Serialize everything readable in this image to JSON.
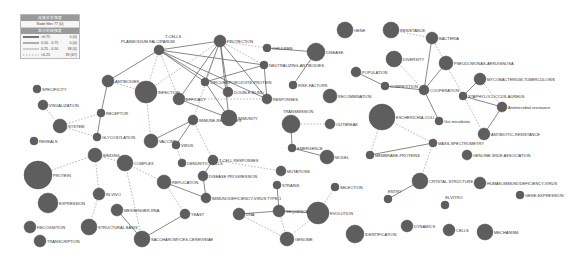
{
  "legend": {
    "title": "连接关系强度",
    "subtitle": "Node filter 77 (0)",
    "header": "显示的线强度",
    "rows": [
      {
        "style": "thick",
        "range": ">0.75",
        "count": "0 (0)"
      },
      {
        "style": "medium",
        "range": "0.50 - 0.75",
        "count": "0 (0)"
      },
      {
        "style": "thin",
        "range": "0.25 - 0.50",
        "count": "38 (0)"
      },
      {
        "style": "dashed",
        "range": "<0.25",
        "count": "39 (67)"
      }
    ]
  },
  "nodes": [
    {
      "id": "t-cells",
      "label": "T-CELLS",
      "x": 159,
      "y": 50,
      "r": 5
    },
    {
      "id": "plasmodium",
      "label": "PLASMODIUM-FALCIPARUM",
      "x": 159,
      "y": 50,
      "r": 0
    },
    {
      "id": "protection",
      "label": "PROTECTION",
      "x": 220,
      "y": 41,
      "r": 6
    },
    {
      "id": "children",
      "label": "CHILDREN",
      "x": 267,
      "y": 48,
      "r": 4
    },
    {
      "id": "disease",
      "label": "DISEASE",
      "x": 316,
      "y": 52,
      "r": 9
    },
    {
      "id": "gene",
      "label": "GENE",
      "x": 345,
      "y": 30,
      "r": 8
    },
    {
      "id": "resistance",
      "label": "RESISTANCE",
      "x": 391,
      "y": 30,
      "r": 8
    },
    {
      "id": "bacteria",
      "label": "BACTERIA",
      "x": 432,
      "y": 38,
      "r": 6
    },
    {
      "id": "diversity",
      "label": "DIVERSITY",
      "x": 394,
      "y": 59,
      "r": 8
    },
    {
      "id": "pseudomonas",
      "label": "PSEUDOMONAS-AERUGINOSA",
      "x": 446,
      "y": 63,
      "r": 7
    },
    {
      "id": "population",
      "label": "POPULATION",
      "x": 356,
      "y": 72,
      "r": 5
    },
    {
      "id": "competition",
      "label": "COMPETITION",
      "x": 385,
      "y": 86,
      "r": 4
    },
    {
      "id": "cooperation",
      "label": "COOPERATION",
      "x": 424,
      "y": 90,
      "r": 5
    },
    {
      "id": "mycobacterium",
      "label": "MYCOBACTERIUM-TUBERCULOSIS",
      "x": 480,
      "y": 79,
      "r": 6
    },
    {
      "id": "staphylococcus",
      "label": "STAPHYLOCOCCUS-AUREUS",
      "x": 463,
      "y": 96,
      "r": 4
    },
    {
      "id": "antimicrobial",
      "label": "Antimicrobial resistance",
      "x": 502,
      "y": 107,
      "r": 5
    },
    {
      "id": "gut-microbiota",
      "label": "Gut microbiota",
      "x": 439,
      "y": 121,
      "r": 4
    },
    {
      "id": "escherichia",
      "label": "ESCHERICHIA-COLI",
      "x": 382,
      "y": 117,
      "r": 13
    },
    {
      "id": "antibiotic",
      "label": "ANTIBIOTIC-RESISTANCE",
      "x": 484,
      "y": 134,
      "r": 6
    },
    {
      "id": "mass-spec",
      "label": "MASS-SPECTROMETRY",
      "x": 433,
      "y": 143,
      "r": 4
    },
    {
      "id": "membrane-proteins",
      "label": "MEMBRANE-PROTEINS",
      "x": 370,
      "y": 155,
      "r": 4
    },
    {
      "id": "gwas",
      "label": "GENOME-WIDE ASSOCIATION",
      "x": 467,
      "y": 155,
      "r": 5
    },
    {
      "id": "crystal-structure",
      "label": "CRYSTAL-STRUCTURE",
      "x": 420,
      "y": 181,
      "r": 8
    },
    {
      "id": "hiv",
      "label": "HUMAN-IMMUNODEFICIENCY-VIRUS",
      "x": 480,
      "y": 183,
      "r": 6
    },
    {
      "id": "gene-expression",
      "label": "GENE-EXPRESSION",
      "x": 520,
      "y": 195,
      "r": 4
    },
    {
      "id": "entry",
      "label": "ENTRY",
      "x": 388,
      "y": 199,
      "r": 4
    },
    {
      "id": "in-vitro",
      "label": "IN-VITRO",
      "x": 445,
      "y": 205,
      "r": 4
    },
    {
      "id": "dynamics",
      "label": "DYNAMICS",
      "x": 407,
      "y": 226,
      "r": 6
    },
    {
      "id": "cells",
      "label": "CELLS",
      "x": 449,
      "y": 230,
      "r": 6
    },
    {
      "id": "mechanism",
      "label": "MECHANISM",
      "x": 485,
      "y": 232,
      "r": 8
    },
    {
      "id": "identification",
      "label": "IDENTIFICATION",
      "x": 355,
      "y": 234,
      "r": 9
    },
    {
      "id": "selection",
      "label": "SELECTION",
      "x": 335,
      "y": 187,
      "r": 4
    },
    {
      "id": "evolution",
      "label": "EVOLUTION",
      "x": 318,
      "y": 213,
      "r": 11
    },
    {
      "id": "sequence",
      "label": "SEQUENCE",
      "x": 279,
      "y": 211,
      "r": 6
    },
    {
      "id": "dna",
      "label": "DNA",
      "x": 239,
      "y": 214,
      "r": 6
    },
    {
      "id": "genome",
      "label": "GENOME",
      "x": 287,
      "y": 239,
      "r": 7
    },
    {
      "id": "strains",
      "label": "STRAINS",
      "x": 277,
      "y": 185,
      "r": 4
    },
    {
      "id": "mutations",
      "label": "MUTATIONS",
      "x": 281,
      "y": 171,
      "r": 5
    },
    {
      "id": "model",
      "label": "MODEL",
      "x": 327,
      "y": 157,
      "r": 7
    },
    {
      "id": "emergence",
      "label": "EMERGENCE",
      "x": 292,
      "y": 148,
      "r": 4
    },
    {
      "id": "transmission",
      "label": "TRANSMISSION",
      "x": 291,
      "y": 124,
      "r": 9
    },
    {
      "id": "outbreak",
      "label": "OUTBREAK",
      "x": 330,
      "y": 124,
      "r": 5
    },
    {
      "id": "recombination",
      "label": "RECOMBINATION",
      "x": 330,
      "y": 96,
      "r": 7
    },
    {
      "id": "risk-factors",
      "label": "RISK-FACTORS",
      "x": 293,
      "y": 85,
      "r": 4
    },
    {
      "id": "neutralizing",
      "label": "NEUTRALIZING-ANTIBODIES",
      "x": 264,
      "y": 65,
      "r": 4
    },
    {
      "id": "responses",
      "label": "RESPONSES",
      "x": 267,
      "y": 99,
      "r": 5
    },
    {
      "id": "double-blind",
      "label": "DOUBLE-BLIND",
      "x": 228,
      "y": 92,
      "r": 5
    },
    {
      "id": "circumsporozoite",
      "label": "CIRCUMSPOROZOITE-PROTEIN",
      "x": 205,
      "y": 82,
      "r": 4
    },
    {
      "id": "efficacy",
      "label": "EFFICACY",
      "x": 179,
      "y": 99,
      "r": 6
    },
    {
      "id": "immune-responses",
      "label": "IMMUNE-RESPONSES",
      "x": 193,
      "y": 120,
      "r": 5
    },
    {
      "id": "immunity",
      "label": "IMMUNITY",
      "x": 229,
      "y": 118,
      "r": 8
    },
    {
      "id": "infection",
      "label": "INFECTION",
      "x": 146,
      "y": 92,
      "r": 11
    },
    {
      "id": "antibodies",
      "label": "ANTIBODIES",
      "x": 108,
      "y": 81,
      "r": 6
    },
    {
      "id": "receptor",
      "label": "RECEPTOR",
      "x": 101,
      "y": 113,
      "r": 4
    },
    {
      "id": "glycosylation",
      "label": "GLYCOSYLATION",
      "x": 97,
      "y": 137,
      "r": 4
    },
    {
      "id": "specificity",
      "label": "SPECIFICITY",
      "x": 37,
      "y": 89,
      "r": 4
    },
    {
      "id": "visualization",
      "label": "VISUALIZATION",
      "x": 43,
      "y": 105,
      "r": 5
    },
    {
      "id": "system",
      "label": "SYSTEM",
      "x": 60,
      "y": 126,
      "r": 7
    },
    {
      "id": "reveals",
      "label": "REVEALS",
      "x": 34,
      "y": 141,
      "r": 4
    },
    {
      "id": "vaccine",
      "label": "VACCINE",
      "x": 151,
      "y": 141,
      "r": 7
    },
    {
      "id": "virus",
      "label": "VIRUS",
      "x": 176,
      "y": 145,
      "r": 4
    },
    {
      "id": "dendritic",
      "label": "DENDRITIC CELLS",
      "x": 182,
      "y": 163,
      "r": 4
    },
    {
      "id": "t-cell-responses",
      "label": "T-CELL RESPONSES",
      "x": 213,
      "y": 160,
      "r": 5
    },
    {
      "id": "disease-progression",
      "label": "DISEASE PROGRESSION",
      "x": 203,
      "y": 176,
      "r": 5
    },
    {
      "id": "hiv1",
      "label": "IMMUNODEFICIENCY-VIRUS TYPE-1",
      "x": 206,
      "y": 198,
      "r": 5
    },
    {
      "id": "binding",
      "label": "BINDING",
      "x": 95,
      "y": 155,
      "r": 7
    },
    {
      "id": "complex",
      "label": "COMPLEX",
      "x": 125,
      "y": 163,
      "r": 8
    },
    {
      "id": "protein",
      "label": "PROTEIN",
      "x": 38,
      "y": 175,
      "r": 14
    },
    {
      "id": "replication",
      "label": "REPLICATION",
      "x": 164,
      "y": 182,
      "r": 7
    },
    {
      "id": "in-vivo",
      "label": "IN-VIVO",
      "x": 99,
      "y": 194,
      "r": 6
    },
    {
      "id": "expression",
      "label": "EXPRESSION",
      "x": 48,
      "y": 203,
      "r": 10
    },
    {
      "id": "messenger-rna",
      "label": "MESSENGER-RNA",
      "x": 117,
      "y": 210,
      "r": 6
    },
    {
      "id": "yeast",
      "label": "YEAST",
      "x": 185,
      "y": 214,
      "r": 5
    },
    {
      "id": "recognition",
      "label": "RECOGNITION",
      "x": 30,
      "y": 227,
      "r": 6
    },
    {
      "id": "structural-basis",
      "label": "STRUCTURAL BASIS",
      "x": 89,
      "y": 227,
      "r": 8
    },
    {
      "id": "saccharomyces",
      "label": "SACCHAROMYCES-CEREVISIAE",
      "x": 142,
      "y": 239,
      "r": 8
    },
    {
      "id": "transcription",
      "label": "TRANSCRIPTION",
      "x": 40,
      "y": 241,
      "r": 6
    }
  ],
  "edges": [
    [
      "t-cells",
      "protection",
      "solid"
    ],
    [
      "t-cells",
      "neutralizing",
      "solid"
    ],
    [
      "t-cells",
      "double-blind",
      "solid"
    ],
    [
      "t-cells",
      "responses",
      "solid"
    ],
    [
      "t-cells",
      "circumsporozoite",
      "solid"
    ],
    [
      "t-cells",
      "efficacy",
      "dashed"
    ],
    [
      "t-cells",
      "infection",
      "dashed"
    ],
    [
      "t-cells",
      "antibodies",
      "solid"
    ],
    [
      "protection",
      "children",
      "dashed"
    ],
    [
      "protection",
      "circumsporozoite",
      "solid"
    ],
    [
      "protection",
      "double-blind",
      "solid"
    ],
    [
      "protection",
      "efficacy",
      "solid"
    ],
    [
      "protection",
      "responses",
      "solid"
    ],
    [
      "protection",
      "neutralizing",
      "dashed"
    ],
    [
      "protection",
      "immunity",
      "solid"
    ],
    [
      "protection",
      "infection",
      "dashed"
    ],
    [
      "protection",
      "immune-responses",
      "dashed"
    ],
    [
      "children",
      "disease",
      "solid"
    ],
    [
      "disease",
      "risk-factors",
      "solid"
    ],
    [
      "neutralizing",
      "responses",
      "solid"
    ],
    [
      "neutralizing",
      "circumsporozoite",
      "solid"
    ],
    [
      "circumsporozoite",
      "immunity",
      "solid"
    ],
    [
      "efficacy",
      "responses",
      "dashed"
    ],
    [
      "efficacy",
      "immunity",
      "solid"
    ],
    [
      "immune-responses",
      "vaccine",
      "solid"
    ],
    [
      "immune-responses",
      "t-cell-responses",
      "dashed"
    ],
    [
      "immune-responses",
      "virus",
      "solid"
    ],
    [
      "antibodies",
      "infection",
      "dashed"
    ],
    [
      "antibodies",
      "receptor",
      "solid"
    ],
    [
      "receptor",
      "glycosylation",
      "solid"
    ],
    [
      "receptor",
      "system",
      "dashed"
    ],
    [
      "system",
      "visualization",
      "dashed"
    ],
    [
      "system",
      "glycosylation",
      "dashed"
    ],
    [
      "infection",
      "vaccine",
      "dashed"
    ],
    [
      "virus",
      "dendritic",
      "dashed"
    ],
    [
      "t-cell-responses",
      "disease-progression",
      "solid"
    ],
    [
      "t-cell-responses",
      "mutations",
      "dashed"
    ],
    [
      "disease-progression",
      "hiv1",
      "solid"
    ],
    [
      "replication",
      "hiv1",
      "solid"
    ],
    [
      "replication",
      "yeast",
      "dashed"
    ],
    [
      "replication",
      "complex",
      "dashed"
    ],
    [
      "binding",
      "protein",
      "dashed"
    ],
    [
      "binding",
      "complex",
      "dashed"
    ],
    [
      "binding",
      "in-vivo",
      "dashed"
    ],
    [
      "in-vivo",
      "structural-basis",
      "dashed"
    ],
    [
      "complex",
      "saccharomyces",
      "dashed"
    ],
    [
      "messenger-rna",
      "saccharomyces",
      "solid"
    ],
    [
      "yeast",
      "saccharomyces",
      "solid"
    ],
    [
      "transmission",
      "outbreak",
      "dashed"
    ],
    [
      "transmission",
      "emergence",
      "solid"
    ],
    [
      "emergence",
      "model",
      "solid"
    ],
    [
      "dna",
      "sequence",
      "solid"
    ],
    [
      "sequence",
      "evolution",
      "solid"
    ],
    [
      "sequence",
      "genome",
      "dashed"
    ],
    [
      "dna",
      "genome",
      "dashed"
    ],
    [
      "evolution",
      "genome",
      "dashed"
    ],
    [
      "evolution",
      "selection",
      "dashed"
    ],
    [
      "strains",
      "sequence",
      "solid"
    ],
    [
      "population",
      "competition",
      "solid"
    ],
    [
      "competition",
      "cooperation",
      "solid"
    ],
    [
      "diversity",
      "cooperation",
      "dashed"
    ],
    [
      "cooperation",
      "bacteria",
      "solid"
    ],
    [
      "cooperation",
      "pseudomonas",
      "solid"
    ],
    [
      "cooperation",
      "gut-microbiota",
      "solid"
    ],
    [
      "resistance",
      "bacteria",
      "dashed"
    ],
    [
      "bacteria",
      "antibiotic",
      "dashed"
    ],
    [
      "mycobacterium",
      "staphylococcus",
      "solid"
    ],
    [
      "staphylococcus",
      "antimicrobial",
      "solid"
    ],
    [
      "mycobacterium",
      "antimicrobial",
      "dashed"
    ],
    [
      "antimicrobial",
      "antibiotic",
      "solid"
    ],
    [
      "escherichia",
      "mass-spec",
      "dashed"
    ],
    [
      "escherichia",
      "membrane-proteins",
      "dashed"
    ],
    [
      "membrane-proteins",
      "mass-spec",
      "solid"
    ],
    [
      "mass-spec",
      "crystal-structure",
      "dashed"
    ],
    [
      "crystal-structure",
      "entry",
      "solid"
    ]
  ]
}
